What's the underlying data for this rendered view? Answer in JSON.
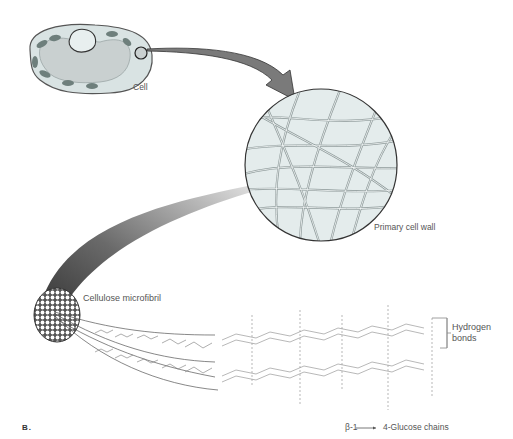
{
  "figure": {
    "panel_letter": "B.",
    "labels": {
      "cell": "Cell",
      "primary_cell_wall": "Primary cell wall",
      "cellulose_microfibril": "Cellulose microfibril",
      "hydrogen_bonds_line1": "Hydrogen",
      "hydrogen_bonds_line2": "bonds",
      "glucose_chains_prefix": "β-1",
      "glucose_chains_suffix": "4-Glucose chains"
    },
    "chem_groups": {
      "oh": "OH",
      "ho": "HO",
      "o": "O"
    },
    "colors": {
      "cell_fill": "#d9e3e3",
      "cell_outline": "#555555",
      "chloroplast": "#6e7f7c",
      "vacuole": "#c9d0d0",
      "wall_fill": "#e4ecec",
      "arrow_fill": "#7a7a7a",
      "fiber_dark": "#333333",
      "text": "#555555"
    }
  }
}
